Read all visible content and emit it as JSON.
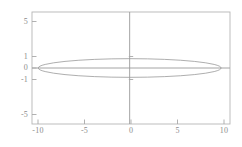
{
  "chart_data": {
    "type": "line",
    "title": "",
    "subtitle": "",
    "xlabel": "",
    "ylabel": "",
    "xlim": [
      -11.0,
      11.3
    ],
    "ylim": [
      -6.0,
      6.0
    ],
    "grid": false,
    "legend": null,
    "axis_lines": {
      "x_axis_at_y": 0,
      "y_axis_at_x": 0
    },
    "xticks": [
      -10,
      -5,
      0,
      5,
      10
    ],
    "xticklabels": [
      "-10",
      "-5",
      "0",
      "5",
      "10"
    ],
    "yticks": [
      5,
      1,
      0,
      -1,
      -5
    ],
    "yticklabels": [
      "5",
      "1",
      "0",
      "-1",
      "-5"
    ],
    "series": [
      {
        "name": "ellipse",
        "shape": "ellipse",
        "center": [
          0,
          0
        ],
        "semi_axis_x": 10.3,
        "semi_axis_y": 1.0,
        "equation": "x^2/106.09 + y^2/1 = 1",
        "color": "#999999",
        "linewidth": 0.8
      }
    ],
    "colors": {
      "curve": "#999999",
      "axis": "#9a9a9a",
      "frame": "#b5b5b5",
      "tick_text": "#8c8c8c",
      "background": "#ffffff"
    }
  },
  "plot": {
    "frame": {
      "left_px": 32,
      "top_px": 12,
      "right_px": 230,
      "bottom_px": 124
    }
  }
}
